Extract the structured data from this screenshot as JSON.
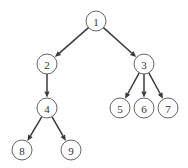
{
  "diagram": {
    "type": "tree",
    "node_radius": 10,
    "colors": {
      "edge": "#3a3a3a",
      "node_stroke": "#555555",
      "node_fill": "#ffffff",
      "label": "#333333",
      "background": "#ffffff"
    },
    "nodes": [
      {
        "id": "1",
        "label": "1",
        "x": 96,
        "y": 21
      },
      {
        "id": "2",
        "label": "2",
        "x": 47,
        "y": 64
      },
      {
        "id": "3",
        "label": "3",
        "x": 144,
        "y": 64
      },
      {
        "id": "4",
        "label": "4",
        "x": 47,
        "y": 108
      },
      {
        "id": "5",
        "label": "5",
        "x": 120,
        "y": 108
      },
      {
        "id": "6",
        "label": "6",
        "x": 144,
        "y": 108
      },
      {
        "id": "7",
        "label": "7",
        "x": 168,
        "y": 108
      },
      {
        "id": "8",
        "label": "8",
        "x": 22,
        "y": 150
      },
      {
        "id": "9",
        "label": "9",
        "x": 71,
        "y": 150
      }
    ],
    "edges": [
      {
        "from": "1",
        "to": "2"
      },
      {
        "from": "1",
        "to": "3"
      },
      {
        "from": "2",
        "to": "4"
      },
      {
        "from": "3",
        "to": "5"
      },
      {
        "from": "3",
        "to": "6"
      },
      {
        "from": "3",
        "to": "7"
      },
      {
        "from": "4",
        "to": "8"
      },
      {
        "from": "4",
        "to": "9"
      }
    ]
  }
}
